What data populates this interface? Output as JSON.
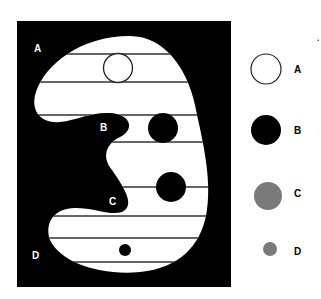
{
  "diagram": {
    "colors": {
      "background": "#ffffff",
      "panel": "#000000",
      "shape": "#ffffff",
      "lines": "#333333",
      "gray": "#7a7a7a"
    },
    "region_labels": [
      {
        "id": "A",
        "text": "A",
        "x": 34,
        "y": 52
      },
      {
        "id": "B",
        "text": "B",
        "x": 100,
        "y": 131
      },
      {
        "id": "C",
        "text": "C",
        "x": 109,
        "y": 205
      },
      {
        "id": "D",
        "text": "D",
        "x": 32,
        "y": 259
      }
    ],
    "shape_circles": [
      {
        "id": "A",
        "cx": 118,
        "cy": 68,
        "r": 15,
        "style": "outline"
      },
      {
        "id": "B",
        "cx": 163,
        "cy": 128,
        "r": 15,
        "style": "black"
      },
      {
        "id": "C",
        "cx": 171,
        "cy": 187,
        "r": 15,
        "style": "black"
      },
      {
        "id": "D",
        "cx": 125,
        "cy": 250,
        "r": 6,
        "style": "black"
      }
    ],
    "legend": [
      {
        "id": "A",
        "label": "A",
        "cx": 266,
        "cy": 69,
        "r": 15,
        "style": "outline",
        "label_x": 294,
        "label_y": 73
      },
      {
        "id": "B",
        "label": "B",
        "cx": 266,
        "cy": 130,
        "r": 15,
        "style": "black",
        "label_x": 294,
        "label_y": 134
      },
      {
        "id": "C",
        "label": "C",
        "cx": 268,
        "cy": 196,
        "r": 14,
        "style": "gray",
        "label_x": 294,
        "label_y": 197
      },
      {
        "id": "D",
        "label": "D",
        "cx": 270,
        "cy": 249,
        "r": 7,
        "style": "gray",
        "label_x": 294,
        "label_y": 255
      }
    ],
    "stray_mark": "•"
  }
}
